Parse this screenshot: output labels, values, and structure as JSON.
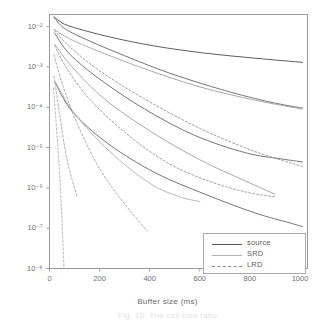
{
  "figure": {
    "caption": "Fig. 10. The cell loss ratio"
  },
  "chart_data": {
    "type": "line",
    "title": "",
    "xlabel": "Buffer size (ms)",
    "ylabel": "CLR",
    "xlim": [
      0,
      1030
    ],
    "ylim": [
      1e-08,
      0.02
    ],
    "yscale": "log",
    "grid": false,
    "legend_position": "lower-right",
    "xticks": [
      0,
      200,
      400,
      600,
      800,
      1000
    ],
    "xticklabels": [
      "0",
      "200",
      "400",
      "600",
      "800",
      "1000"
    ],
    "yticks": [
      0.01,
      0.001,
      0.0001,
      1e-05,
      1e-06,
      1e-07,
      1e-08
    ],
    "yticklabels": [
      "10⁻²",
      "10⁻³",
      "10⁻⁴",
      "10⁻⁵",
      "10⁻⁶",
      "10⁻⁷",
      "10⁻⁸"
    ],
    "legend": [
      {
        "label": "source",
        "style": "solid",
        "color": "#53545a"
      },
      {
        "label": "SRD",
        "style": "solid",
        "color": "#a3a4a8"
      },
      {
        "label": "LRD",
        "style": "dashed",
        "color": "#8b8c90"
      }
    ],
    "series": [
      {
        "name": "source-1",
        "group": "source",
        "style": "solid",
        "color": "#53545a",
        "x": [
          18,
          60,
          140,
          260,
          420,
          620,
          820,
          1010
        ],
        "y": [
          0.0175,
          0.0115,
          0.008,
          0.0052,
          0.0033,
          0.0022,
          0.00165,
          0.0013
        ]
      },
      {
        "name": "source-2",
        "group": "source",
        "style": "solid",
        "color": "#6d6e72",
        "x": [
          18,
          60,
          160,
          300,
          480,
          700,
          880,
          1010
        ],
        "y": [
          0.0172,
          0.009,
          0.0044,
          0.0019,
          0.0007,
          0.00026,
          0.000135,
          9.5e-05
        ]
      },
      {
        "name": "source-3",
        "group": "source",
        "style": "solid",
        "color": "#6d6e72",
        "x": [
          20,
          80,
          200,
          380,
          580,
          780,
          920,
          1010
        ],
        "y": [
          0.007,
          0.0021,
          0.0005,
          9e-05,
          2e-05,
          7.5e-06,
          5.3e-06,
          4.4e-06
        ]
      },
      {
        "name": "source-4",
        "group": "source",
        "style": "solid",
        "color": "#6d6e72",
        "x": [
          22,
          90,
          230,
          420,
          620,
          820,
          960,
          1010
        ],
        "y": [
          0.00042,
          8e-05,
          1.3e-05,
          2.4e-06,
          7e-07,
          2.4e-07,
          1.35e-07,
          1.1e-07
        ]
      },
      {
        "name": "srd-1",
        "group": "SRD",
        "style": "solid",
        "color": "#a3a4a8",
        "x": [
          20,
          80,
          200,
          380,
          600,
          820,
          1010
        ],
        "y": [
          0.0085,
          0.005,
          0.0024,
          0.0009,
          0.00032,
          0.00015,
          9e-05
        ]
      },
      {
        "name": "srd-2",
        "group": "SRD",
        "style": "solid",
        "color": "#a3a4a8",
        "x": [
          22,
          90,
          220,
          400,
          600,
          780,
          900
        ],
        "y": [
          0.0036,
          0.001,
          0.00016,
          2.6e-05,
          5e-06,
          1.5e-06,
          7e-07
        ]
      },
      {
        "name": "srd-3",
        "group": "SRD",
        "style": "solid",
        "color": "#b4b5b9",
        "x": [
          24,
          100,
          240,
          400,
          520,
          600
        ],
        "y": [
          0.00042,
          7e-05,
          8e-06,
          1.3e-06,
          6e-07,
          4.6e-07
        ]
      },
      {
        "name": "lrd-1",
        "group": "LRD",
        "style": "dashed",
        "color": "#8b8c90",
        "x": [
          20,
          80,
          200,
          380,
          600,
          820,
          1010
        ],
        "y": [
          0.008,
          0.0032,
          0.0008,
          0.00016,
          3e-05,
          8e-06,
          3.4e-06
        ]
      },
      {
        "name": "lrd-2",
        "group": "LRD",
        "style": "dashed",
        "color": "#8b8c90",
        "x": [
          20,
          70,
          160,
          300,
          460,
          620,
          780,
          900
        ],
        "y": [
          0.0034,
          0.0009,
          0.00016,
          2.4e-05,
          4.6e-06,
          1.6e-06,
          8e-07,
          6e-07
        ]
      },
      {
        "name": "lrd-3",
        "group": "LRD",
        "style": "dashed",
        "color": "#9b9c9f",
        "x": [
          18,
          50,
          110,
          200,
          300,
          390
        ],
        "y": [
          0.002,
          0.0004,
          4e-05,
          3e-06,
          4e-07,
          8.5e-08
        ]
      },
      {
        "name": "lrd-4",
        "group": "LRD",
        "style": "dashed",
        "color": "#9b9c9f",
        "x": [
          18,
          40,
          70,
          110
        ],
        "y": [
          0.0006,
          7e-05,
          5e-06,
          6e-07
        ]
      },
      {
        "name": "lrd-5",
        "group": "LRD",
        "style": "dashed",
        "color": "#a8a9ac",
        "x": [
          16,
          30,
          45,
          58
        ],
        "y": [
          0.0003,
          2e-05,
          7e-07,
          1e-08
        ]
      }
    ]
  }
}
